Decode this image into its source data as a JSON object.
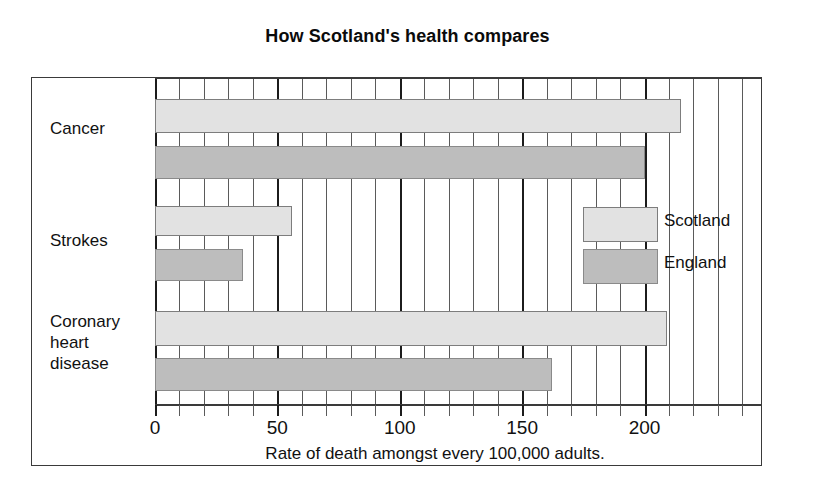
{
  "chart_data": {
    "type": "bar",
    "orientation": "horizontal",
    "title": "How Scotland's health compares",
    "xlabel": "Rate of death amongst every 100,000 adults.",
    "ylabel": "",
    "categories": [
      "Cancer",
      "Strokes",
      "Coronary\nheart\ndisease"
    ],
    "series": [
      {
        "name": "Scotland",
        "color": "#e2e2e2",
        "values": [
          215,
          56,
          209
        ]
      },
      {
        "name": "England",
        "color": "#bdbdbd",
        "values": [
          200,
          36,
          162
        ]
      }
    ],
    "xlim": [
      0,
      248
    ],
    "xticks": [
      0,
      50,
      100,
      150,
      200
    ],
    "xtick_labels": [
      "0",
      "50",
      "100",
      "150",
      "200"
    ],
    "minor_tick_step": 10,
    "grid": true,
    "grid_axis": "x",
    "legend_position": "inside-right-middle"
  },
  "legend": {
    "entries": [
      {
        "label": "Scotland"
      },
      {
        "label": "England"
      }
    ]
  }
}
